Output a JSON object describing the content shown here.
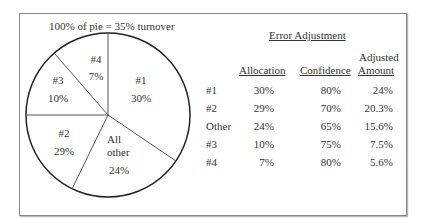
{
  "chart_data": {
    "type": "pie",
    "title": "100% of pie = 35% turnover",
    "slices": [
      {
        "label": "#1",
        "value": 30
      },
      {
        "label": "All other",
        "value": 24
      },
      {
        "label": "#2",
        "value": 29
      },
      {
        "label": "#3",
        "value": 10
      },
      {
        "label": "#4",
        "value": 7
      }
    ],
    "value_suffix": "%"
  },
  "table": {
    "title": "Error Adjustment",
    "headers": [
      "",
      "Allocation",
      "Confidence",
      "Adjusted Amount"
    ],
    "header_adjusted_line1": "Adjusted",
    "header_adjusted_line2": "Amount",
    "rows": [
      [
        "#1",
        "30%",
        "80%",
        "24%"
      ],
      [
        "#2",
        "29%",
        "70%",
        "20.3%"
      ],
      [
        "Other",
        "24%",
        "65%",
        "15.6%"
      ],
      [
        "#3",
        "10%",
        "75%",
        "7.5%"
      ],
      [
        "#4",
        "7%",
        "80%",
        "5.6%"
      ]
    ]
  },
  "pie_labels": {
    "s1_name": "#1",
    "s1_val": "30%",
    "s2_name1": "All",
    "s2_name2": "other",
    "s2_val": "24%",
    "s3_name": "#2",
    "s3_val": "29%",
    "s4_name": "#3",
    "s4_val": "10%",
    "s5_name": "#4",
    "s5_val": "7%"
  }
}
